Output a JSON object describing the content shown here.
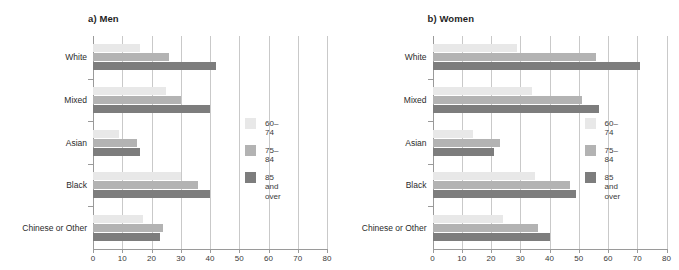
{
  "chart_data": [
    {
      "type": "bar",
      "title": "a) Men",
      "orientation": "horizontal",
      "xlabel": "",
      "ylabel": "",
      "xlim": [
        0,
        80
      ],
      "xticks": [
        0,
        10,
        20,
        30,
        40,
        50,
        60,
        70,
        80
      ],
      "grid": true,
      "legend_position": "right",
      "categories": [
        "White",
        "Mixed",
        "Asian",
        "Black",
        "Chinese or Other"
      ],
      "series": [
        {
          "name": "60–74",
          "color": "#e8e8e8",
          "values": [
            16,
            25,
            9,
            30,
            17
          ]
        },
        {
          "name": "75–84",
          "color": "#b3b3b3",
          "values": [
            26,
            30,
            15,
            36,
            24
          ]
        },
        {
          "name": "85 and\nover",
          "color": "#7d7d7d",
          "values": [
            42,
            40,
            16,
            40,
            23
          ]
        }
      ]
    },
    {
      "type": "bar",
      "title": "b) Women",
      "orientation": "horizontal",
      "xlabel": "",
      "ylabel": "",
      "xlim": [
        0,
        80
      ],
      "xticks": [
        0,
        10,
        20,
        30,
        40,
        50,
        60,
        70,
        80
      ],
      "grid": true,
      "legend_position": "right",
      "categories": [
        "White",
        "Mixed",
        "Asian",
        "Black",
        "Chinese or Other"
      ],
      "series": [
        {
          "name": "60–74",
          "color": "#e8e8e8",
          "values": [
            29,
            34,
            14,
            35,
            24
          ]
        },
        {
          "name": "75–84",
          "color": "#b3b3b3",
          "values": [
            56,
            51,
            23,
            47,
            36
          ]
        },
        {
          "name": "85 and\nover",
          "color": "#7d7d7d",
          "values": [
            71,
            57,
            21,
            49,
            40
          ]
        }
      ]
    }
  ],
  "panels": [
    {
      "title": "a) Men"
    },
    {
      "title": "b) Women"
    }
  ],
  "legend": {
    "items": [
      {
        "label": "60–74"
      },
      {
        "label": "75–84"
      },
      {
        "label": "85 and\nover"
      }
    ]
  }
}
